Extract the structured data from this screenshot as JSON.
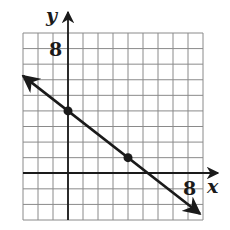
{
  "chart_data": {
    "type": "line",
    "title": "",
    "xlabel": "x",
    "ylabel": "y",
    "xlim": [
      -3,
      9
    ],
    "ylim": [
      -3,
      9
    ],
    "grid": true,
    "grid_step": 1,
    "tick_labels": {
      "x": [
        "8"
      ],
      "y": [
        "8"
      ]
    },
    "series": [
      {
        "name": "line",
        "equation": "y = -3/4 x + 4",
        "slope": -0.75,
        "intercept": 4,
        "arrows": "both",
        "points": [
          {
            "x": 0,
            "y": 4
          },
          {
            "x": 4,
            "y": 1
          }
        ]
      }
    ]
  },
  "labels": {
    "x_axis": "x",
    "y_axis": "y",
    "x_tick": "8",
    "y_tick": "8"
  },
  "colors": {
    "grid": "#8a8a8a",
    "axis": "#1a1a1a",
    "line": "#1a1a1a"
  }
}
